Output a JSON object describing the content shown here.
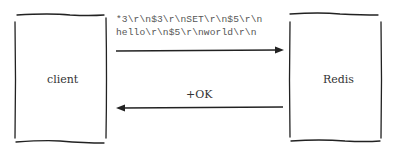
{
  "diagram": {
    "nodes": [
      {
        "id": "client",
        "label": "client"
      },
      {
        "id": "redis",
        "label": "Redis"
      }
    ],
    "edges": [
      {
        "from": "client",
        "to": "redis",
        "label_lines": [
          "*3\\r\\n$3\\r\\nSET\\r\\n$5\\r\\n",
          "hello\\r\\n$5\\r\\nworld\\r\\n"
        ]
      },
      {
        "from": "redis",
        "to": "client",
        "label": "+OK"
      }
    ]
  }
}
